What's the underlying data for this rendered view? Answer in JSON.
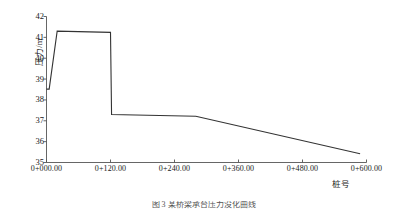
{
  "chart_data": {
    "type": "line",
    "title": "",
    "caption": "图 3  某桥梁承台压力没化曲线",
    "xlabel": "桩号",
    "ylabel": "压力/m",
    "xlim": [
      0,
      600
    ],
    "ylim": [
      35,
      42
    ],
    "grid": false,
    "legend": null,
    "x_tick_labels": [
      "0+000.00",
      "0+120.00",
      "0+240.00",
      "0+360.00",
      "0+480.00",
      "0+600.00"
    ],
    "x_tick_values": [
      0,
      120,
      240,
      360,
      480,
      600
    ],
    "y_tick_labels": [
      "35",
      "36",
      "37",
      "38",
      "39",
      "40",
      "41",
      "42"
    ],
    "y_tick_values": [
      35,
      36,
      37,
      38,
      39,
      40,
      41,
      42
    ],
    "series": [
      {
        "name": "压力",
        "color": "#333333",
        "x": [
          0,
          5,
          20,
          120,
          122,
          280,
          588
        ],
        "y": [
          38.52,
          38.52,
          41.3,
          41.24,
          37.3,
          37.22,
          35.42
        ]
      }
    ],
    "annotations": []
  },
  "axis": {
    "y_title": "压力/m",
    "x_title": "桩号"
  },
  "caption": {
    "text": "图 3  某桥梁承台压力没化曲线"
  },
  "colors": {
    "line": "#333333",
    "axis": "#555555",
    "text": "#1a1a1a",
    "background": "#ffffff"
  }
}
